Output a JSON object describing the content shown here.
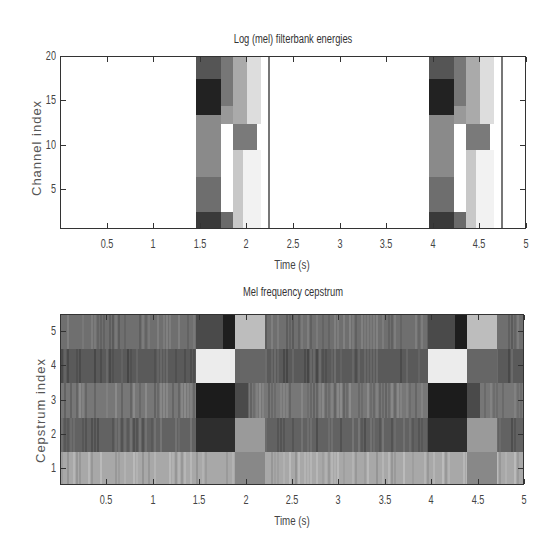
{
  "chart_data": [
    {
      "type": "heatmap",
      "title": "Log (mel) filterbank energies",
      "xlabel": "Time (s)",
      "ylabel": "Channel index",
      "xlim": [
        0,
        5
      ],
      "ylim": [
        0.5,
        20
      ],
      "xticks": [
        "0.5",
        "1",
        "1.5",
        "2",
        "2.5",
        "3",
        "3.5",
        "4",
        "4.5",
        "5"
      ],
      "yticks": [
        "5",
        "10",
        "15",
        "20"
      ],
      "colormap": "gray (dark = high energy)",
      "regions": [
        {
          "t0": 1.45,
          "t1": 1.72,
          "c0": 0.5,
          "c1": 2.5,
          "shade": "#3a3a3a"
        },
        {
          "t0": 1.45,
          "t1": 1.72,
          "c0": 2.5,
          "c1": 6.5,
          "shade": "#6e6e6e"
        },
        {
          "t0": 1.45,
          "t1": 1.72,
          "c0": 6.5,
          "c1": 13.5,
          "shade": "#8a8a8a"
        },
        {
          "t0": 1.45,
          "t1": 1.72,
          "c0": 13.5,
          "c1": 17.5,
          "shade": "#222"
        },
        {
          "t0": 1.45,
          "t1": 1.72,
          "c0": 17.5,
          "c1": 20,
          "shade": "#555"
        },
        {
          "t0": 1.72,
          "t1": 1.85,
          "c0": 0.5,
          "c1": 2.5,
          "shade": "#6a6a6a"
        },
        {
          "t0": 1.72,
          "t1": 1.85,
          "c0": 2.5,
          "c1": 12.5,
          "shade": "#ffffff"
        },
        {
          "t0": 1.72,
          "t1": 1.85,
          "c0": 12.5,
          "c1": 14.5,
          "shade": "#999"
        },
        {
          "t0": 1.72,
          "t1": 1.85,
          "c0": 14.5,
          "c1": 20,
          "shade": "#777"
        },
        {
          "t0": 1.85,
          "t1": 1.95,
          "c0": 0.5,
          "c1": 9.5,
          "shade": "#c8c8c8"
        },
        {
          "t0": 1.85,
          "t1": 2.1,
          "c0": 9.5,
          "c1": 12.5,
          "shade": "#7a7a7a"
        },
        {
          "t0": 1.85,
          "t1": 2.0,
          "c0": 12.5,
          "c1": 20,
          "shade": "#aaa"
        },
        {
          "t0": 2.0,
          "t1": 2.15,
          "c0": 12.5,
          "c1": 20,
          "shade": "#ddd"
        },
        {
          "t0": 1.95,
          "t1": 2.15,
          "c0": 0.5,
          "c1": 9.5,
          "shade": "#f2f2f2"
        },
        {
          "t0": 3.95,
          "t1": 4.22,
          "c0": 0.5,
          "c1": 2.5,
          "shade": "#3a3a3a"
        },
        {
          "t0": 3.95,
          "t1": 4.22,
          "c0": 2.5,
          "c1": 6.5,
          "shade": "#6e6e6e"
        },
        {
          "t0": 3.95,
          "t1": 4.22,
          "c0": 6.5,
          "c1": 13.5,
          "shade": "#8a8a8a"
        },
        {
          "t0": 3.95,
          "t1": 4.22,
          "c0": 13.5,
          "c1": 17.5,
          "shade": "#222"
        },
        {
          "t0": 3.95,
          "t1": 4.22,
          "c0": 17.5,
          "c1": 20,
          "shade": "#555"
        },
        {
          "t0": 4.22,
          "t1": 4.35,
          "c0": 0.5,
          "c1": 2.5,
          "shade": "#6a6a6a"
        },
        {
          "t0": 4.22,
          "t1": 4.35,
          "c0": 2.5,
          "c1": 12.5,
          "shade": "#ffffff"
        },
        {
          "t0": 4.22,
          "t1": 4.35,
          "c0": 12.5,
          "c1": 14.5,
          "shade": "#999"
        },
        {
          "t0": 4.22,
          "t1": 4.35,
          "c0": 14.5,
          "c1": 20,
          "shade": "#777"
        },
        {
          "t0": 4.35,
          "t1": 4.45,
          "c0": 0.5,
          "c1": 9.5,
          "shade": "#c8c8c8"
        },
        {
          "t0": 4.35,
          "t1": 4.6,
          "c0": 9.5,
          "c1": 12.5,
          "shade": "#7a7a7a"
        },
        {
          "t0": 4.35,
          "t1": 4.5,
          "c0": 12.5,
          "c1": 20,
          "shade": "#aaa"
        },
        {
          "t0": 4.5,
          "t1": 4.65,
          "c0": 12.5,
          "c1": 20,
          "shade": "#ddd"
        },
        {
          "t0": 4.45,
          "t1": 4.65,
          "c0": 0.5,
          "c1": 9.5,
          "shade": "#f2f2f2"
        }
      ],
      "vlines": [
        {
          "t": 2.22,
          "shade": "#777"
        },
        {
          "t": 4.72,
          "shade": "#777"
        }
      ]
    },
    {
      "type": "heatmap",
      "title": "Mel frequency cepstrum",
      "xlabel": "Time (s)",
      "ylabel": "Cepstrum index",
      "xlim": [
        0,
        5
      ],
      "ylim": [
        0.5,
        5.5
      ],
      "xticks": [
        "0.5",
        "1",
        "1.5",
        "2",
        "2.5",
        "3",
        "3.5",
        "4",
        "4.5",
        "5"
      ],
      "yticks": [
        "1",
        "2",
        "3",
        "4",
        "5"
      ],
      "colormap": "gray",
      "rows": [
        {
          "index": 5,
          "base": "#6f6f6f"
        },
        {
          "index": 4,
          "base": "#5a5a5a"
        },
        {
          "index": 3,
          "base": "#777777"
        },
        {
          "index": 2,
          "base": "#626262"
        },
        {
          "index": 1,
          "base": "#a8a8a8"
        }
      ],
      "regions": [
        {
          "t0": 1.45,
          "t1": 1.75,
          "c0": 4.5,
          "c1": 5.5,
          "shade": "#4a4a4a"
        },
        {
          "t0": 1.75,
          "t1": 1.87,
          "c0": 4.5,
          "c1": 5.5,
          "shade": "#1e1e1e"
        },
        {
          "t0": 1.87,
          "t1": 2.2,
          "c0": 4.5,
          "c1": 5.5,
          "shade": "#bdbdbd"
        },
        {
          "t0": 1.45,
          "t1": 1.87,
          "c0": 3.5,
          "c1": 4.5,
          "shade": "#ececec"
        },
        {
          "t0": 1.87,
          "t1": 2.2,
          "c0": 3.5,
          "c1": 4.5,
          "shade": "#666"
        },
        {
          "t0": 1.45,
          "t1": 1.87,
          "c0": 2.5,
          "c1": 3.5,
          "shade": "#1c1c1c"
        },
        {
          "t0": 1.87,
          "t1": 2.02,
          "c0": 2.5,
          "c1": 3.5,
          "shade": "#4a4a4a"
        },
        {
          "t0": 1.45,
          "t1": 1.87,
          "c0": 1.5,
          "c1": 2.5,
          "shade": "#2e2e2e"
        },
        {
          "t0": 1.87,
          "t1": 2.2,
          "c0": 1.5,
          "c1": 2.5,
          "shade": "#9a9a9a"
        },
        {
          "t0": 1.87,
          "t1": 2.2,
          "c0": 0.5,
          "c1": 1.5,
          "shade": "#888"
        },
        {
          "t0": 3.95,
          "t1": 4.25,
          "c0": 4.5,
          "c1": 5.5,
          "shade": "#4a4a4a"
        },
        {
          "t0": 4.25,
          "t1": 4.37,
          "c0": 4.5,
          "c1": 5.5,
          "shade": "#1e1e1e"
        },
        {
          "t0": 4.37,
          "t1": 4.7,
          "c0": 4.5,
          "c1": 5.5,
          "shade": "#bdbdbd"
        },
        {
          "t0": 3.95,
          "t1": 4.37,
          "c0": 3.5,
          "c1": 4.5,
          "shade": "#ececec"
        },
        {
          "t0": 4.37,
          "t1": 4.7,
          "c0": 3.5,
          "c1": 4.5,
          "shade": "#666"
        },
        {
          "t0": 3.95,
          "t1": 4.37,
          "c0": 2.5,
          "c1": 3.5,
          "shade": "#1c1c1c"
        },
        {
          "t0": 4.37,
          "t1": 4.52,
          "c0": 2.5,
          "c1": 3.5,
          "shade": "#4a4a4a"
        },
        {
          "t0": 3.95,
          "t1": 4.37,
          "c0": 1.5,
          "c1": 2.5,
          "shade": "#2e2e2e"
        },
        {
          "t0": 4.37,
          "t1": 4.7,
          "c0": 1.5,
          "c1": 2.5,
          "shade": "#9a9a9a"
        },
        {
          "t0": 4.37,
          "t1": 4.7,
          "c0": 0.5,
          "c1": 1.5,
          "shade": "#888"
        }
      ]
    }
  ]
}
